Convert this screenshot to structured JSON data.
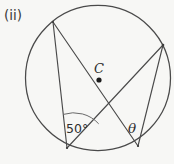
{
  "figure": {
    "part_label": "(ii)",
    "center_label": "C",
    "angle_left_label": "50°",
    "angle_right_label": "θ",
    "background_color": "#f7f7f5",
    "stroke_color": "#4a4a4a",
    "circle": {
      "cx": 98,
      "cy": 78,
      "r": 72.5
    },
    "center_point": {
      "x": 99,
      "y": 80
    },
    "points": [
      {
        "name": "A",
        "role": "top-left-vertex",
        "x": 53,
        "y": 22
      },
      {
        "name": "B",
        "role": "right-vertex",
        "x": 163,
        "y": 45
      },
      {
        "name": "D",
        "role": "bottom-left-vertex",
        "x": 67,
        "y": 148
      },
      {
        "name": "E",
        "role": "bottom-right-vertex",
        "x": 138,
        "y": 146
      }
    ],
    "chords": [
      {
        "name": "chord-A-D",
        "from": "A",
        "to": "D"
      },
      {
        "name": "chord-A-E",
        "from": "A",
        "to": "E"
      },
      {
        "name": "chord-B-D",
        "from": "B",
        "to": "D"
      },
      {
        "name": "chord-B-E",
        "from": "B",
        "to": "E"
      }
    ],
    "angle_marks": [
      {
        "name": "angle-50-arc",
        "at": "D",
        "label": "50°"
      },
      {
        "name": "angle-theta",
        "at": "E",
        "label": "θ"
      }
    ]
  }
}
